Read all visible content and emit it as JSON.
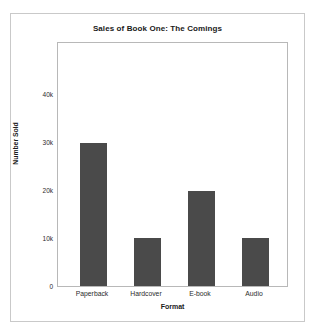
{
  "chart_data": {
    "type": "bar",
    "title": "Sales of Book One: The Comings",
    "xlabel": "Format",
    "ylabel": "Number Sold",
    "categories": [
      "Paperback",
      "Hardcover",
      "E-book",
      "Audio"
    ],
    "values": [
      30000,
      10000,
      20000,
      10000
    ],
    "ytick_labels": [
      "0",
      "10k",
      "20k",
      "30k",
      "40k"
    ],
    "ytick_values": [
      0,
      10000,
      20000,
      30000,
      40000
    ],
    "ylim": [
      0,
      51000
    ],
    "grid": false,
    "legend": null,
    "bar_color": "#4a4a4a",
    "plot_background": "#ffffff",
    "frame_color": "#b8b8b8",
    "outer_frame_color": "#c9c9c9"
  }
}
